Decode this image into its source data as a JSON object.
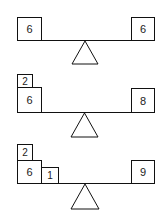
{
  "balances": [
    {
      "left": [
        {
          "value": "6"
        }
      ],
      "right": [
        {
          "value": "6"
        }
      ]
    },
    {
      "left": [
        {
          "value": "2"
        },
        {
          "value": "6"
        }
      ],
      "right": [
        {
          "value": "8"
        }
      ]
    },
    {
      "left": [
        {
          "value": "2"
        },
        {
          "value": "6"
        },
        {
          "value": "1"
        }
      ],
      "right": [
        {
          "value": "9"
        }
      ]
    }
  ]
}
